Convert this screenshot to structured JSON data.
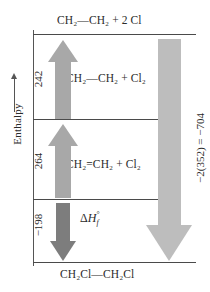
{
  "axis": {
    "label": "Enthalpy",
    "arrow_icon": "up-arrow-icon",
    "direction": "increasing upward"
  },
  "levels": [
    {
      "id": "level-top",
      "species": "CH₂—CH₂ + 2 Cl"
    },
    {
      "id": "level-second",
      "species": "CH₂—CH₂ + Cl₂"
    },
    {
      "id": "level-third",
      "species": "CH₂=CH₂ + Cl₂"
    },
    {
      "id": "level-bottom",
      "species": "CH₂Cl—CH₂Cl"
    }
  ],
  "arrows": [
    {
      "id": "arrow-242",
      "label": "242",
      "direction": "up",
      "color": "#a8a8a8",
      "from_level": "level-second",
      "to_level": "level-top"
    },
    {
      "id": "arrow-264",
      "label": "264",
      "direction": "up",
      "color": "#a8a8a8",
      "from_level": "level-third",
      "to_level": "level-second"
    },
    {
      "id": "arrow-198",
      "label": "−198",
      "direction": "down",
      "color": "#7d7d7d",
      "from_level": "level-third",
      "to_level": "level-bottom",
      "annotation": "ΔH°f"
    },
    {
      "id": "arrow-704",
      "label": "−2(352) = −704",
      "direction": "down",
      "color": "#bdbdbd",
      "from_level": "level-top",
      "to_level": "level-bottom"
    }
  ],
  "chart_data": {
    "type": "diagram",
    "title": "",
    "ylabel": "Enthalpy",
    "categories": [
      "CH₂Cl—CH₂Cl",
      "CH₂=CH₂ + Cl₂",
      "CH₂—CH₂ + Cl₂",
      "CH₂—CH₂ + 2 Cl"
    ],
    "transitions": [
      {
        "from": "CH₂=CH₂ + Cl₂",
        "to": "CH₂—CH₂ + Cl₂",
        "value": 264
      },
      {
        "from": "CH₂—CH₂ + Cl₂",
        "to": "CH₂—CH₂ + 2 Cl",
        "value": 242
      },
      {
        "from": "CH₂=CH₂ + Cl₂",
        "to": "CH₂Cl—CH₂Cl",
        "value": -198
      },
      {
        "from": "CH₂—CH₂ + 2 Cl",
        "to": "CH₂Cl—CH₂Cl",
        "value": -704
      }
    ],
    "grid": false,
    "legend": "none"
  },
  "dhf": {
    "delta": "Δ",
    "h": "H",
    "sup": "°",
    "sub": "f"
  }
}
